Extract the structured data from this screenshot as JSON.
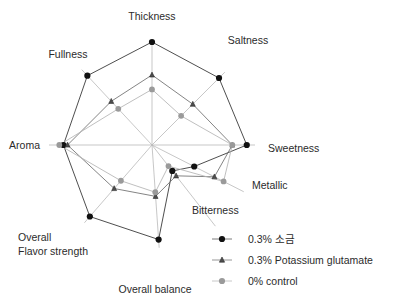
{
  "chart_data": {
    "type": "radar",
    "title": "",
    "categories": [
      "Thickness",
      "Saltness",
      "Sweetness",
      "Metallic",
      "Bitterness",
      "Overall balance",
      "Overall\nFlavor strength",
      "Aroma",
      "Fullness"
    ],
    "axis_angles_deg": [
      90,
      45,
      0,
      -27,
      -52,
      -86,
      -131,
      180,
      133
    ],
    "rmax": 5,
    "grid": false,
    "legend_position": "bottom-right",
    "series": [
      {
        "name": "0.3% 소금",
        "marker": "circle",
        "color": "#111111",
        "line_color": "#3a3a3a",
        "values": [
          5.0,
          4.6,
          4.6,
          2.3,
          1.6,
          4.6,
          4.6,
          4.3,
          4.6
        ]
      },
      {
        "name": "0.3% Potassium glutamate",
        "marker": "triangle",
        "color": "#4d4d4d",
        "line_color": "#6e6e6e",
        "values": [
          3.4,
          2.8,
          3.9,
          3.4,
          1.9,
          2.5,
          2.8,
          4.1,
          2.9
        ]
      },
      {
        "name": "0%  control",
        "marker": "circle",
        "color": "#9a9a9a",
        "line_color": "#b3b3b3",
        "values": [
          2.7,
          2.0,
          3.9,
          3.9,
          1.3,
          2.3,
          2.3,
          4.5,
          2.4
        ]
      }
    ],
    "axis_labels": {
      "thickness": "Thickness",
      "saltness": "Saltness",
      "sweetness": "Sweetness",
      "metallic": "Metallic",
      "bitterness": "Bitterness",
      "overall_balance": "Overall balance",
      "overall_flavor_strength_line1": "Overall",
      "overall_flavor_strength_line2": "Flavor strength",
      "aroma": "Aroma",
      "fullness": "Fullness"
    },
    "legend": [
      {
        "label": "0.3% 소금",
        "marker": "circle",
        "color": "#111111"
      },
      {
        "label": "0.3% Potassium glutamate",
        "marker": "triangle",
        "color": "#4d4d4d"
      },
      {
        "label": "0%  control",
        "marker": "circle",
        "color": "#9a9a9a"
      }
    ],
    "colors": {
      "spoke": "#b9b9b9",
      "background": "#ffffff",
      "text": "#2b2b2b"
    }
  }
}
